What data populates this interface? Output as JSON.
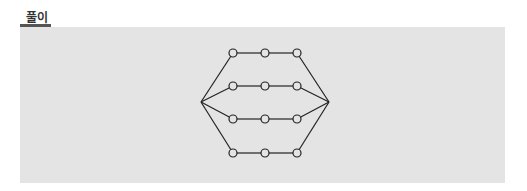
{
  "header": {
    "label": "풀이"
  },
  "colors": {
    "panel": "#e4e4e4",
    "line": "#222222",
    "underline": "#555555"
  },
  "diagram": {
    "endpoints": [
      {
        "id": "L",
        "x": 201,
        "y": 102
      },
      {
        "id": "R",
        "x": 329,
        "y": 102
      }
    ],
    "rows": [
      {
        "y": 53,
        "nodes": [
          233,
          265,
          297
        ]
      },
      {
        "y": 86,
        "nodes": [
          233,
          265,
          297
        ]
      },
      {
        "y": 119,
        "nodes": [
          233,
          265,
          297
        ]
      },
      {
        "y": 153,
        "nodes": [
          233,
          265,
          297
        ]
      }
    ],
    "node_radius": 4
  }
}
